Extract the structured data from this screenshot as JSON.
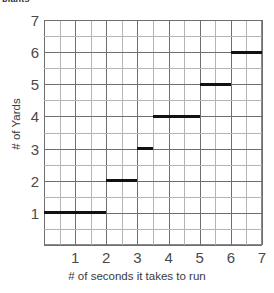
{
  "clipped_caption": "plants",
  "chart_data": {
    "type": "line",
    "subtype": "step",
    "title": "",
    "xlabel": "# of seconds it takes to run",
    "ylabel": "# of Yards",
    "xlim": [
      0,
      7
    ],
    "ylim": [
      0,
      7
    ],
    "xticks": [
      1,
      2,
      3,
      4,
      5,
      6,
      7
    ],
    "yticks": [
      1,
      2,
      3,
      4,
      5,
      6,
      7
    ],
    "xtick_labels": [
      "1",
      "2",
      "3",
      "4",
      "5",
      "6",
      "7"
    ],
    "ytick_labels": [
      "1",
      "2",
      "3",
      "4",
      "5",
      "6",
      "7"
    ],
    "grid": true,
    "grid_major_step": 1,
    "grid_minor_step": 0.5,
    "legend": false,
    "legend_position": "none",
    "series_color": "#111111",
    "grid_major_color": "#6e6e6e",
    "grid_minor_color": "#b4b4b4",
    "axis_color": "#8a8a8a",
    "segments": [
      {
        "y": 1,
        "x_start": 0,
        "x_end": 2
      },
      {
        "y": 2,
        "x_start": 2,
        "x_end": 3
      },
      {
        "y": 3,
        "x_start": 3,
        "x_end": 3.5
      },
      {
        "y": 4,
        "x_start": 3.5,
        "x_end": 5
      },
      {
        "y": 5,
        "x_start": 5,
        "x_end": 6
      },
      {
        "y": 6,
        "x_start": 6,
        "x_end": 7
      }
    ],
    "x": [
      0,
      2,
      3,
      3.5,
      5,
      6,
      7
    ],
    "values": [
      1,
      2,
      3,
      4,
      5,
      6,
      6
    ]
  }
}
